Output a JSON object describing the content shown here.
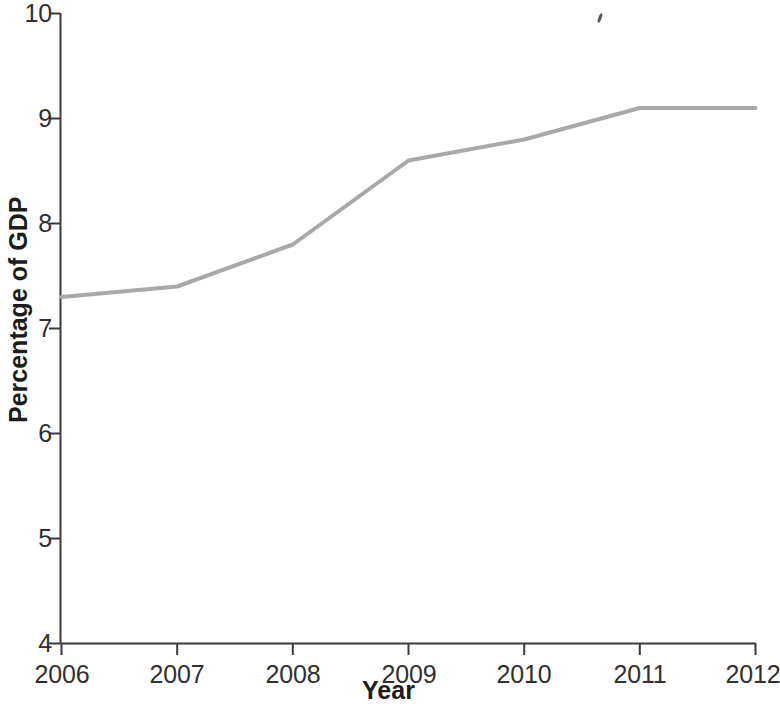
{
  "chart_data": {
    "type": "line",
    "title": "",
    "xlabel": "Year",
    "ylabel": "Percentage of GDP",
    "x": [
      2006,
      2007,
      2008,
      2009,
      2010,
      2011,
      2012
    ],
    "values": [
      7.3,
      7.4,
      7.8,
      8.6,
      8.8,
      9.1,
      9.1
    ],
    "series": [
      {
        "name": "Percentage of GDP",
        "values": [
          7.3,
          7.4,
          7.8,
          8.6,
          8.8,
          9.1,
          9.1
        ]
      }
    ],
    "xlim": [
      2006,
      2012
    ],
    "ylim": [
      4,
      10
    ],
    "x_tick_labels": [
      "2006",
      "2007",
      "2008",
      "2009",
      "2010",
      "2011",
      "2012"
    ],
    "y_tick_labels": [
      "4",
      "5",
      "6",
      "7",
      "8",
      "9",
      "10"
    ],
    "y_ticks": [
      4,
      5,
      6,
      7,
      8,
      9,
      10
    ],
    "grid": false,
    "legend": false,
    "line_color": "#a8a8a8",
    "axis_color": "#3a3a3a"
  },
  "axes": {
    "x_title": "Year",
    "y_title": "Percentage of GDP"
  },
  "y_labels": {
    "t10": "10",
    "t9": "9",
    "t8": "8",
    "t7": "7",
    "t6": "6",
    "t5": "5",
    "t4": "4"
  },
  "x_labels": {
    "t2006": "2006",
    "t2007": "2007",
    "t2008": "2008",
    "t2009": "2009",
    "t2010": "2010",
    "t2011": "2011",
    "t2012": "2012"
  }
}
